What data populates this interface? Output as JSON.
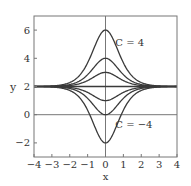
{
  "chart_data": {
    "type": "line",
    "title": "",
    "xlabel": "x",
    "ylabel": "y",
    "xlim": [
      -4,
      4
    ],
    "ylim": [
      -3,
      7
    ],
    "xticks": [
      -4,
      -3,
      -2,
      -1,
      0,
      1,
      2,
      3,
      4
    ],
    "xtick_labels": [
      "−4",
      "−3",
      "−2",
      "−1",
      "0",
      "1",
      "2",
      "3",
      "4"
    ],
    "yticks": [
      -2,
      0,
      2,
      4,
      6
    ],
    "ytick_labels": [
      "−2",
      "0",
      "2",
      "4",
      "6"
    ],
    "grid": false,
    "reference_lines": {
      "x0": true,
      "y0": true
    },
    "function_form": "y = 2 + C sech^2(x)",
    "series": [
      {
        "name": "C = 4",
        "C": 4,
        "peak_at_x0": 6
      },
      {
        "name": "C = 2",
        "C": 2,
        "peak_at_x0": 4
      },
      {
        "name": "C = 1",
        "C": 1,
        "peak_at_x0": 3
      },
      {
        "name": "C = 0",
        "C": 0,
        "peak_at_x0": 2
      },
      {
        "name": "C = -1",
        "C": -1,
        "peak_at_x0": 1
      },
      {
        "name": "C = -2",
        "C": -2,
        "peak_at_x0": 0
      },
      {
        "name": "C = -4",
        "C": -4,
        "peak_at_x0": -2
      }
    ],
    "annotations": [
      {
        "text": "C = 4",
        "x": 0.55,
        "y": 4.9
      },
      {
        "text": "C = −4",
        "x": 0.55,
        "y": -0.95
      }
    ]
  },
  "colors": {
    "curve": "#3a3a3a",
    "axes": "#777777",
    "text": "#333333"
  }
}
